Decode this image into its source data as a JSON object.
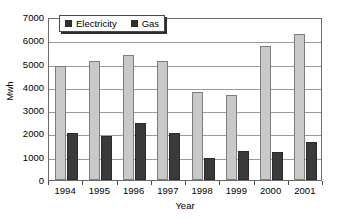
{
  "chart_data": {
    "type": "bar",
    "title": "",
    "xlabel": "Year",
    "ylabel": "Mwh",
    "categories": [
      "1994",
      "1995",
      "1996",
      "1997",
      "1998",
      "1999",
      "2000",
      "2001"
    ],
    "series": [
      {
        "name": "Electricity",
        "color": "#3a3a3a",
        "values": [
          2000,
          1880,
          2450,
          2000,
          950,
          1250,
          1200,
          1620
        ]
      },
      {
        "name": "Gas",
        "color": "#c9c9c9",
        "values": [
          4900,
          5100,
          5350,
          5100,
          3800,
          3650,
          5750,
          6250
        ]
      }
    ],
    "ylim": [
      0,
      7000
    ],
    "yticks": [
      0,
      1000,
      2000,
      3000,
      4000,
      5000,
      6000,
      7000
    ],
    "ytick_labels": [
      "0",
      "1000",
      "2000",
      "3000",
      "4000",
      "5000",
      "6000",
      "7000"
    ],
    "grid": true,
    "legend_position": "top-left-inside",
    "legend_entries": [
      "Electricity",
      "Gas"
    ]
  }
}
